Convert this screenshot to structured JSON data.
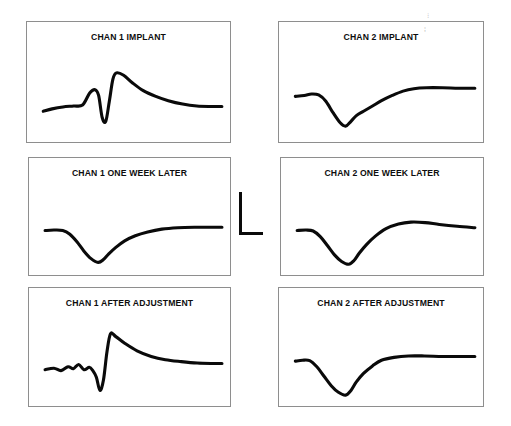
{
  "figure": {
    "width": 511,
    "height": 426,
    "background": "#ffffff",
    "trace_color": "#0a0a0a",
    "panel_border_color": "#8e8e8e",
    "title_color": "#0d0d0d"
  },
  "artifact": {
    "label": "scan-speckle"
  },
  "scalebar": {
    "label": "L-shaped amplitude and time calibration marker",
    "x": 239,
    "y": 192,
    "vertical_length": 40,
    "horizontal_length": 24,
    "thickness": 3,
    "color": "#0a0a0a"
  },
  "panels": [
    {
      "id": "chan-1-implant",
      "title": "CHAN 1 IMPLANT",
      "x": 26,
      "y": 21,
      "width": 205,
      "height": 122,
      "title_top": 10
    },
    {
      "id": "chan-2-implant",
      "title": "CHAN 2 IMPLANT",
      "x": 278,
      "y": 21,
      "width": 206,
      "height": 122,
      "title_top": 10
    },
    {
      "id": "chan-1-one-week-later",
      "title": "CHAN 1 ONE WEEK LATER",
      "x": 28,
      "y": 157,
      "width": 203,
      "height": 119,
      "title_top": 10
    },
    {
      "id": "chan-2-one-week-later",
      "title": "CHAN 2 ONE WEEK LATER",
      "x": 280,
      "y": 157,
      "width": 204,
      "height": 119,
      "title_top": 10
    },
    {
      "id": "chan-1-after-adjustment",
      "title": "CHAN 1 AFTER ADJUSTMENT",
      "x": 28,
      "y": 287,
      "width": 203,
      "height": 120,
      "title_top": 10
    },
    {
      "id": "chan-2-after-adjustment",
      "title": "CHAN 2 AFTER ADJUSTMENT",
      "x": 278,
      "y": 287,
      "width": 206,
      "height": 120,
      "title_top": 10
    }
  ],
  "chart_data": {
    "type": "line",
    "xlabel": "",
    "ylabel": "",
    "grid": false,
    "legend": false,
    "axes_visible": false,
    "xlim": [
      0,
      100
    ],
    "ylim": [
      -100,
      100
    ],
    "units_note": "Unlabeled axes; amplitude and time indicated only by the L-shaped calibration marker between the middle panels.",
    "series": [
      {
        "name": "CHAN 1 IMPLANT",
        "panel": "chan-1-implant",
        "shape": "small positive hump, sharp negative spike, large positive peak, slow decay to baseline",
        "x": [
          0,
          5,
          11,
          17,
          22,
          26,
          29,
          31,
          33,
          35,
          37,
          39,
          41,
          45,
          50,
          56,
          63,
          70,
          78,
          86,
          94,
          100
        ],
        "y": [
          -31,
          -26,
          -22,
          -20,
          -18,
          7,
          14,
          2,
          -44,
          -52,
          -10,
          36,
          49,
          44,
          28,
          12,
          0,
          -9,
          -16,
          -20,
          -21,
          -21
        ]
      },
      {
        "name": "CHAN 2 IMPLANT",
        "panel": "chan-2-implant",
        "shape": "flat baseline, shallow positive shoulder, deep negative trough, slow rise to elevated plateau",
        "x": [
          0,
          5,
          9,
          13,
          17,
          21,
          25,
          28,
          31,
          34,
          38,
          43,
          48,
          54,
          60,
          66,
          73,
          82,
          91,
          100
        ],
        "y": [
          0,
          2,
          5,
          3,
          -10,
          -34,
          -55,
          -62,
          -52,
          -40,
          -31,
          -20,
          -9,
          2,
          11,
          16,
          18,
          18,
          17,
          17
        ]
      },
      {
        "name": "CHAN 1 ONE WEEK LATER",
        "panel": "chan-1-one-week-later",
        "shape": "flat baseline, smooth deep negative trough, gradual recovery to flat plateau above baseline",
        "x": [
          0,
          5,
          10,
          14,
          18,
          22,
          26,
          30,
          33,
          36,
          40,
          45,
          51,
          58,
          66,
          75,
          85,
          95,
          100
        ],
        "y": [
          0,
          1,
          0,
          -8,
          -24,
          -44,
          -60,
          -68,
          -62,
          -50,
          -36,
          -22,
          -11,
          -3,
          3,
          6,
          7,
          7,
          7
        ]
      },
      {
        "name": "CHAN 2 ONE WEEK LATER",
        "panel": "chan-2-one-week-later",
        "shape": "flat baseline, deep negative trough, overshoot to rounded positive peak, slow slight decline",
        "x": [
          0,
          5,
          9,
          13,
          17,
          21,
          25,
          29,
          32,
          35,
          39,
          44,
          50,
          57,
          64,
          72,
          80,
          90,
          100
        ],
        "y": [
          0,
          1,
          -1,
          -13,
          -32,
          -52,
          -66,
          -72,
          -64,
          -48,
          -30,
          -12,
          4,
          14,
          18,
          17,
          13,
          9,
          6
        ]
      },
      {
        "name": "CHAN 1 AFTER ADJUSTMENT",
        "panel": "chan-1-after-adjustment",
        "shape": "low-amplitude ripple, small negative notch, sharp deep negative spike, tall positive peak, slow decay",
        "x": [
          0,
          5,
          9,
          13,
          16,
          19,
          22,
          25,
          27,
          29,
          31,
          33,
          35,
          37,
          40,
          45,
          52,
          60,
          68,
          77,
          86,
          95,
          100
        ],
        "y": [
          -18,
          -15,
          -20,
          -12,
          -16,
          -7,
          -18,
          -13,
          -20,
          -34,
          -62,
          -40,
          20,
          58,
          52,
          38,
          22,
          10,
          3,
          -1,
          -4,
          -5,
          -5
        ]
      },
      {
        "name": "CHAN 2 AFTER ADJUSTMENT",
        "panel": "chan-2-after-adjustment",
        "shape": "flat baseline, deep narrow negative trough, fast recovery to flat plateau slightly above baseline",
        "x": [
          0,
          4,
          8,
          12,
          16,
          20,
          24,
          28,
          31,
          34,
          38,
          43,
          48,
          55,
          63,
          72,
          82,
          92,
          100
        ],
        "y": [
          0,
          2,
          1,
          -12,
          -32,
          -52,
          -66,
          -72,
          -62,
          -44,
          -26,
          -10,
          2,
          8,
          11,
          11,
          10,
          10,
          10
        ]
      }
    ]
  }
}
